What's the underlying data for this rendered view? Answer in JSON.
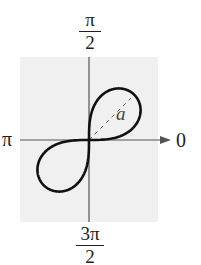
{
  "figure": {
    "type": "polar-graph",
    "equation_shape": "lemniscate r^2 = a^2 sin(2θ)",
    "labels": {
      "top": {
        "num": "π",
        "den": "2"
      },
      "bottom": {
        "num": "3π",
        "den": "2"
      },
      "left": "π",
      "right": "0",
      "curve_label": "a"
    },
    "colors": {
      "background_box": "#f0f0f0",
      "axes": "#555555",
      "curve": "#111111",
      "dashed": "#666666",
      "text": "#231f20"
    }
  },
  "chart_data": {
    "type": "line",
    "title": "",
    "coordinate_system": "polar",
    "curve": "lemniscate r^2 = a^2 sin(2θ)",
    "loops_in_quadrants": [
      "I",
      "III"
    ],
    "max_r": "a",
    "max_r_angle": "π/4",
    "angle_labels": [
      "0",
      "π/2",
      "π",
      "3π/2"
    ],
    "annotations": [
      "a (dashed segment from pole to loop tip at θ = π/4)"
    ],
    "grid": false
  }
}
